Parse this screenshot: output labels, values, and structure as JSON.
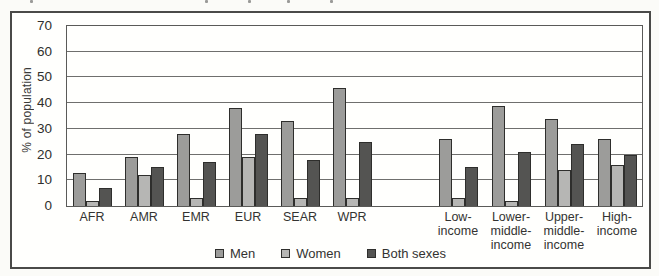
{
  "figure": {
    "ylabel": "% of population",
    "legend_note": "legend shown below chart inside figure frame"
  },
  "chart_data": {
    "type": "bar",
    "title": "",
    "xlabel": "",
    "ylabel": "% of population",
    "ylim": [
      0,
      70
    ],
    "yticks": [
      0,
      10,
      20,
      30,
      40,
      50,
      60,
      70
    ],
    "grid": "horizontal",
    "legend_position": "bottom-center",
    "categories": [
      "AFR",
      "AMR",
      "EMR",
      "EUR",
      "SEAR",
      "WPR",
      "Low-income",
      "Lower-middle-income",
      "Upper-middle-income",
      "High-income"
    ],
    "category_label_lines": [
      [
        "AFR"
      ],
      [
        "AMR"
      ],
      [
        "EMR"
      ],
      [
        "EUR"
      ],
      [
        "SEAR"
      ],
      [
        "WPR"
      ],
      [
        "Low-",
        "income"
      ],
      [
        "Lower-",
        "middle-",
        "income"
      ],
      [
        "Upper-",
        "middle-",
        "income"
      ],
      [
        "High-",
        "income"
      ]
    ],
    "category_sections": [
      "region",
      "region",
      "region",
      "region",
      "region",
      "region",
      "income",
      "income",
      "income",
      "income"
    ],
    "series": [
      {
        "name": "Men",
        "color": "#9c9c9a",
        "values": [
          13,
          19,
          28,
          38,
          33,
          46,
          26,
          39,
          34,
          26
        ]
      },
      {
        "name": "Women",
        "color": "#b6b6b4",
        "values": [
          2,
          12,
          3,
          19,
          3,
          3,
          3,
          2,
          14,
          16
        ]
      },
      {
        "name": "Both sexes",
        "color": "#545452",
        "values": [
          7,
          15,
          17,
          28,
          18,
          25,
          15,
          21,
          24,
          20
        ]
      }
    ]
  },
  "legend": {
    "items": [
      {
        "label": "Men",
        "color": "#9c9c9a"
      },
      {
        "label": "Women",
        "color": "#b6b6b4"
      },
      {
        "label": "Both sexes",
        "color": "#545452"
      }
    ]
  }
}
